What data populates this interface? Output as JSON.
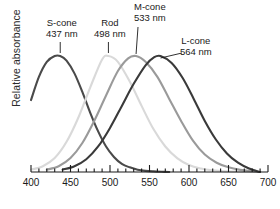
{
  "chart_data": {
    "type": "line",
    "title": "",
    "xlabel": "",
    "ylabel": "Relative absorbance",
    "xlim": [
      400,
      700
    ],
    "ylim": [
      0,
      1
    ],
    "grid": false,
    "legend_position": "inline-callouts",
    "x_major_tick_step": 50,
    "x_minor_tick_step": 10,
    "x_tick_labels": [
      "400",
      "450",
      "500",
      "550",
      "600",
      "650",
      "700"
    ],
    "x_tick_values": [
      400,
      450,
      500,
      550,
      600,
      650,
      700
    ],
    "y_tick_labels": [],
    "series": [
      {
        "name": "S-cone",
        "peak_nm": 437,
        "peak_label": "437 nm",
        "color": "#4a4a4a",
        "x": [
          400,
          410,
          420,
          430,
          437,
          445,
          455,
          465,
          475,
          485,
          495,
          505,
          515,
          525,
          535,
          545,
          555,
          565,
          575
        ],
        "values": [
          0.62,
          0.82,
          0.95,
          1.0,
          1.0,
          0.96,
          0.85,
          0.69,
          0.51,
          0.35,
          0.22,
          0.13,
          0.07,
          0.04,
          0.02,
          0.01,
          0.005,
          0.002,
          0.0
        ]
      },
      {
        "name": "Rod",
        "peak_nm": 498,
        "peak_label": "498 nm",
        "color": "#d9d9d9",
        "x": [
          400,
          415,
          430,
          445,
          460,
          475,
          490,
          498,
          510,
          525,
          540,
          555,
          570,
          585,
          600,
          615,
          630,
          645,
          660,
          675,
          690
        ],
        "values": [
          0.02,
          0.05,
          0.12,
          0.26,
          0.47,
          0.73,
          0.97,
          1.0,
          0.95,
          0.78,
          0.57,
          0.37,
          0.22,
          0.12,
          0.06,
          0.03,
          0.014,
          0.006,
          0.003,
          0.001,
          0.0
        ]
      },
      {
        "name": "M-cone",
        "peak_nm": 533,
        "peak_label": "533 nm",
        "color": "#9a9a9a",
        "x": [
          420,
          435,
          450,
          465,
          480,
          495,
          510,
          523,
          533,
          545,
          560,
          575,
          590,
          605,
          620,
          635,
          650,
          665,
          680,
          690
        ],
        "values": [
          0.02,
          0.05,
          0.12,
          0.25,
          0.44,
          0.66,
          0.87,
          0.98,
          1.0,
          0.95,
          0.82,
          0.63,
          0.44,
          0.27,
          0.15,
          0.08,
          0.04,
          0.018,
          0.006,
          0.0
        ]
      },
      {
        "name": "L-cone",
        "peak_nm": 564,
        "peak_label": "564 nm",
        "color": "#3a3a3a",
        "x": [
          440,
          455,
          470,
          485,
          500,
          515,
          530,
          545,
          556,
          564,
          578,
          592,
          606,
          620,
          634,
          648,
          662,
          676,
          690
        ],
        "values": [
          0.02,
          0.05,
          0.11,
          0.22,
          0.38,
          0.57,
          0.76,
          0.92,
          0.99,
          1.0,
          0.94,
          0.81,
          0.63,
          0.44,
          0.28,
          0.16,
          0.08,
          0.03,
          0.0
        ]
      }
    ],
    "annotations": [
      {
        "name": "S-cone",
        "line1": "S-cone",
        "line2": "437 nm",
        "leader": "vertical"
      },
      {
        "name": "Rod",
        "line1": "Rod",
        "line2": "498 nm",
        "leader": "vertical"
      },
      {
        "name": "M-cone",
        "line1": "M-cone",
        "line2": "533 nm",
        "leader": "diagonal"
      },
      {
        "name": "L-cone",
        "line1": "L-cone",
        "line2": "564 nm",
        "leader": "diagonal"
      }
    ]
  }
}
